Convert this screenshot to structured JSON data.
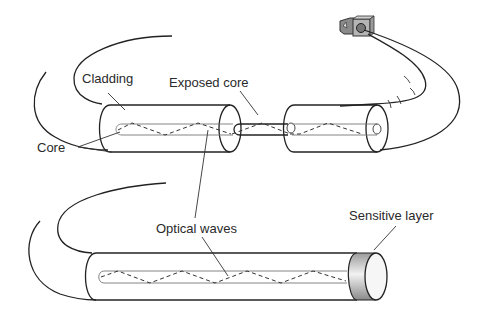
{
  "diagram": {
    "type": "optical fiber sensor schematic",
    "labels": {
      "cladding": "Cladding",
      "exposed_core": "Exposed core",
      "core": "Core",
      "optical_waves": "Optical waves",
      "sensitive_layer": "Sensitive layer"
    },
    "components": [
      "connector",
      "fiber-cable",
      "cladding-segment-left",
      "exposed-core-segment",
      "cladding-segment-right",
      "fiber-cable-lower",
      "sensing-fiber",
      "sensitive-layer-cap"
    ],
    "colors": {
      "line": "#222222",
      "core_line": "#777777",
      "connector": "#8a8a8a",
      "sensitive_layer_light": "#f2f2f2",
      "sensitive_layer_dark": "#9a9a9a"
    }
  }
}
